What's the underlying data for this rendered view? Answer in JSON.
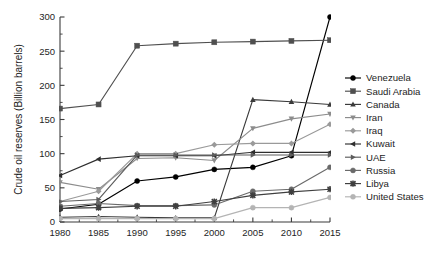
{
  "chart_data": {
    "type": "line",
    "title": "",
    "xlabel": "",
    "ylabel": "Crude oil reserves (Billion barrels)",
    "x": [
      1980,
      1985,
      1990,
      1995,
      2000,
      2005,
      2010,
      2015
    ],
    "xticklabels": [
      "1980",
      "1985",
      "1990",
      "1995",
      "2000",
      "2005",
      "2010",
      "2015"
    ],
    "yticklabels": [
      "0",
      "50",
      "100",
      "150",
      "200",
      "250",
      "300"
    ],
    "yticks": [
      0,
      50,
      100,
      150,
      200,
      250,
      300
    ],
    "xlim": [
      1980,
      2015
    ],
    "ylim": [
      0,
      300
    ],
    "grid": false,
    "legend_position": "right",
    "series": [
      {
        "name": "Venezuela",
        "marker": "circle",
        "color": "#000000",
        "values": [
          19,
          26,
          60,
          66,
          77,
          80,
          97,
          300
        ]
      },
      {
        "name": "Saudi Arabia",
        "marker": "square",
        "color": "#4f4f4f",
        "values": [
          166,
          172,
          258,
          261,
          263,
          264,
          265,
          266
        ]
      },
      {
        "name": "Canada",
        "marker": "triangle-up",
        "color": "#3a3a3a",
        "values": [
          7,
          8,
          7,
          6,
          6,
          179,
          176,
          172
        ]
      },
      {
        "name": "Iran",
        "marker": "triangle-down",
        "color": "#8c8c8c",
        "values": [
          58,
          48,
          93,
          94,
          90,
          137,
          151,
          158
        ]
      },
      {
        "name": "Iraq",
        "marker": "diamond",
        "color": "#9a9a9a",
        "values": [
          30,
          45,
          100,
          100,
          113,
          115,
          115,
          143
        ]
      },
      {
        "name": "Kuwait",
        "marker": "triangle-left",
        "color": "#2e2e2e",
        "values": [
          68,
          92,
          97,
          97,
          97,
          102,
          102,
          102
        ]
      },
      {
        "name": "UAE",
        "marker": "triangle-right",
        "color": "#5c5c5c",
        "values": [
          30,
          33,
          98,
          98,
          98,
          98,
          98,
          98
        ]
      },
      {
        "name": "Russia",
        "marker": "circle",
        "color": "#6a6a6a",
        "values": [
          23,
          27,
          24,
          24,
          25,
          45,
          48,
          80
        ]
      },
      {
        "name": "Libya",
        "marker": "star",
        "color": "#3f3f3f",
        "values": [
          20,
          21,
          23,
          23,
          30,
          39,
          44,
          48
        ]
      },
      {
        "name": "United States",
        "marker": "circle-light",
        "color": "#b4b4b4",
        "values": [
          5,
          5,
          5,
          5,
          5,
          21,
          21,
          36
        ]
      }
    ]
  }
}
